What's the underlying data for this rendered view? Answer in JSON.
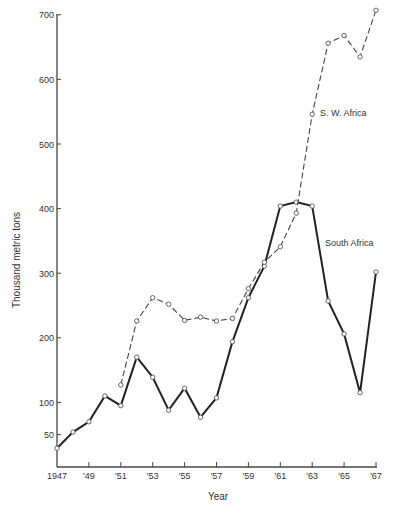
{
  "chart_data": {
    "type": "line",
    "title": "",
    "xlabel": "Year",
    "ylabel": "Thousand metric tons",
    "x": [
      1947,
      1948,
      1949,
      1950,
      1951,
      1952,
      1953,
      1954,
      1955,
      1956,
      1957,
      1958,
      1959,
      1960,
      1961,
      1962,
      1963,
      1964,
      1965,
      1966,
      1967
    ],
    "x_tick_labels": [
      "1947",
      "'49",
      "'51",
      "'53",
      "'55",
      "'57",
      "'59",
      "'61",
      "'63",
      "'65",
      "'67"
    ],
    "x_tick_values": [
      1947,
      1949,
      1951,
      1953,
      1955,
      1957,
      1959,
      1961,
      1963,
      1965,
      1967
    ],
    "y_tick_labels": [
      "50",
      "100",
      "200",
      "300",
      "400",
      "500",
      "600",
      "700"
    ],
    "y_tick_values": [
      50,
      100,
      200,
      300,
      400,
      500,
      600,
      700
    ],
    "xlim": [
      1947,
      1967
    ],
    "ylim": [
      0,
      700
    ],
    "grid": false,
    "legend": "inline labels",
    "series": [
      {
        "name": "South Africa",
        "style": "solid",
        "color": "#222222",
        "label_pos": [
          325,
          246
        ],
        "values": [
          29,
          54,
          70,
          110,
          95,
          170,
          139,
          88,
          122,
          77,
          107,
          194,
          262,
          311,
          404,
          410,
          404,
          257,
          206,
          115,
          302
        ]
      },
      {
        "name": "S. W. Africa",
        "style": "dashed",
        "color": "#444444",
        "label_pos": [
          320,
          116
        ],
        "values": [
          null,
          null,
          null,
          null,
          127,
          226,
          262,
          252,
          227,
          232,
          226,
          230,
          276,
          317,
          341,
          393,
          546,
          656,
          668,
          635,
          707
        ]
      }
    ]
  }
}
